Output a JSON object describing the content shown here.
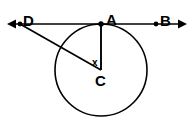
{
  "figure": {
    "background_color": "#ffffff",
    "stroke_color": "#000000",
    "width": 195,
    "height": 126,
    "labels": {
      "point_d": "D",
      "point_a": "A",
      "point_b": "B",
      "point_c": "C",
      "angle_x": "x"
    },
    "points": {
      "D": {
        "x": 20,
        "y": 24
      },
      "A": {
        "x": 101,
        "y": 24
      },
      "B": {
        "x": 156,
        "y": 24
      },
      "C": {
        "x": 101,
        "y": 70
      }
    },
    "circle": {
      "center_x": 101,
      "center_y": 70,
      "radius": 46
    },
    "lines": [
      {
        "name": "tangent-line-DAB",
        "from_x": 8,
        "from_y": 24,
        "to_x": 186,
        "to_y": 24,
        "arrow_start": true,
        "arrow_end": true
      },
      {
        "name": "segment-DC",
        "from_x": 20,
        "from_y": 24,
        "to_x": 101,
        "to_y": 70,
        "arrow_start": false,
        "arrow_end": false
      },
      {
        "name": "radius-AC",
        "from_x": 101,
        "from_y": 24,
        "to_x": 101,
        "to_y": 70,
        "arrow_start": false,
        "arrow_end": false
      }
    ],
    "dots": [
      {
        "name": "point-dot-D",
        "x": 20,
        "y": 24,
        "r": 2.4
      },
      {
        "name": "point-dot-A",
        "x": 101,
        "y": 24,
        "r": 2.6
      },
      {
        "name": "point-dot-B",
        "x": 156,
        "y": 24,
        "r": 2.4
      }
    ]
  }
}
